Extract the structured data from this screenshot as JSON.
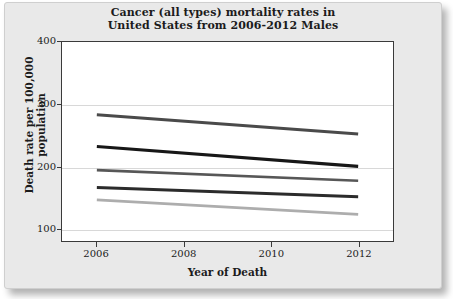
{
  "chart_data": {
    "type": "line",
    "title": "Cancer (all types) mortality rates in United States from 2006-2012 Males",
    "title_line1": "Cancer (all types) mortality rates in",
    "title_line2": "United States from 2006-2012 Males",
    "xlabel": "Year of Death",
    "ylabel": "Death rate per 100,000 population",
    "x": [
      2006,
      2012
    ],
    "xlim": [
      2005.2,
      2012.8
    ],
    "ylim": [
      80,
      400
    ],
    "xticks": [
      "2006",
      "2008",
      "2010",
      "2012"
    ],
    "xtick_values": [
      2006,
      2008,
      2010,
      2012
    ],
    "yticks": [
      "100",
      "200",
      "300",
      "400"
    ],
    "ytick_values": [
      100,
      200,
      300,
      400
    ],
    "grid": "horizontal",
    "legend": "none",
    "series": [
      {
        "name": "series-1",
        "color": "#4a4a4a",
        "width": 3.0,
        "values": [
          283,
          252
        ]
      },
      {
        "name": "series-2",
        "color": "#171717",
        "width": 3.2,
        "values": [
          232,
          200
        ]
      },
      {
        "name": "series-3",
        "color": "#575757",
        "width": 2.6,
        "values": [
          194,
          177
        ]
      },
      {
        "name": "series-4",
        "color": "#2b2b2b",
        "width": 3.0,
        "values": [
          166,
          151
        ]
      },
      {
        "name": "series-5",
        "color": "#adadad",
        "width": 2.8,
        "values": [
          146,
          123
        ]
      }
    ]
  }
}
